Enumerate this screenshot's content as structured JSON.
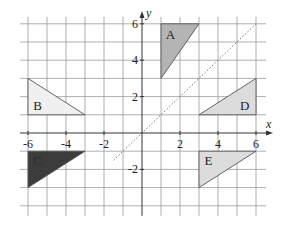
{
  "diagram": {
    "type": "coordinate-grid-transformations",
    "axes": {
      "x_label": "x",
      "y_label": "y",
      "x_range": [
        -6,
        6
      ],
      "y_range": [
        -4,
        6
      ],
      "x_ticks": [
        {
          "value": -6,
          "label": "-6"
        },
        {
          "value": -4,
          "label": "-4"
        },
        {
          "value": -2,
          "label": "-2"
        },
        {
          "value": 2,
          "label": "2"
        },
        {
          "value": 4,
          "label": "4"
        },
        {
          "value": 6,
          "label": "6"
        }
      ],
      "y_ticks": [
        {
          "value": 6,
          "label": "6"
        },
        {
          "value": 4,
          "label": "4"
        },
        {
          "value": 2,
          "label": "2"
        },
        {
          "value": -2,
          "label": "-2"
        }
      ]
    },
    "mirror_line": {
      "equation": "y = x",
      "style": "dotted",
      "from": [
        -1.5,
        -1.5
      ],
      "to": [
        6,
        6
      ]
    },
    "shapes": [
      {
        "label": "A",
        "vertices": [
          [
            1,
            6
          ],
          [
            3,
            6
          ],
          [
            1,
            3
          ]
        ],
        "fill": "#b4b4b4",
        "label_at": [
          1.5,
          5.4
        ]
      },
      {
        "label": "B",
        "vertices": [
          [
            -6,
            3
          ],
          [
            -6,
            1
          ],
          [
            -3,
            1
          ]
        ],
        "fill": "#f0f0f0",
        "label_at": [
          -5.5,
          1.5
        ]
      },
      {
        "label": "C",
        "vertices": [
          [
            -6,
            -1
          ],
          [
            -3,
            -1
          ],
          [
            -6,
            -3
          ]
        ],
        "fill": "#3c3c3c",
        "label_at": [
          -5.5,
          -1.5
        ]
      },
      {
        "label": "D",
        "vertices": [
          [
            3,
            1
          ],
          [
            6,
            1
          ],
          [
            6,
            3
          ]
        ],
        "fill": "#dcdcdc",
        "label_at": [
          5.4,
          1.5
        ]
      },
      {
        "label": "E",
        "vertices": [
          [
            3,
            -1
          ],
          [
            6,
            -1
          ],
          [
            3,
            -3
          ]
        ],
        "fill": "#dcdcdc",
        "label_at": [
          3.5,
          -1.5
        ]
      }
    ]
  }
}
